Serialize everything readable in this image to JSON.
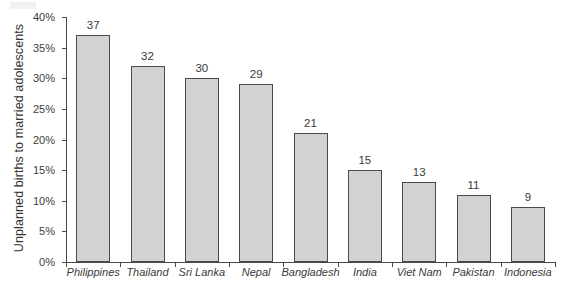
{
  "chart_data": {
    "type": "bar",
    "title": "",
    "xlabel": "",
    "ylabel": "Unplanned births to married adolescents",
    "categories": [
      "Philippines",
      "Thailand",
      "Sri Lanka",
      "Nepal",
      "Bangladesh",
      "India",
      "Viet Nam",
      "Pakistan",
      "Indonesia"
    ],
    "values": [
      37,
      32,
      30,
      29,
      21,
      15,
      13,
      11,
      9
    ],
    "value_labels": [
      "37",
      "32",
      "30",
      "29",
      "21",
      "15",
      "13",
      "11",
      "9"
    ],
    "ylim": [
      0,
      40
    ],
    "ytick_values": [
      0,
      5,
      10,
      15,
      20,
      25,
      30,
      35,
      40
    ],
    "ytick_labels": [
      "0%",
      "5%",
      "10%",
      "15%",
      "20%",
      "25%",
      "30%",
      "35%",
      "40%"
    ],
    "grid": false,
    "legend": null,
    "bar_color": "#d2d2d2",
    "bar_border_color": "#4a4a4a",
    "axis_color": "#4a4a4a",
    "background_color": "#ffffff"
  }
}
